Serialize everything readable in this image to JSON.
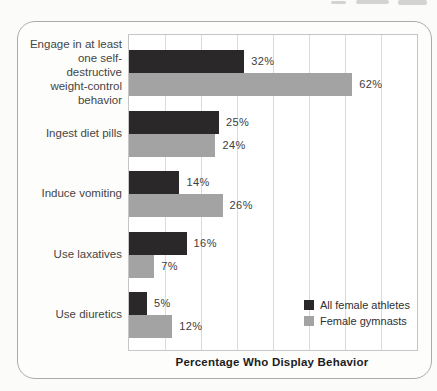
{
  "chart_data": {
    "type": "bar",
    "orientation": "horizontal",
    "title": "",
    "xlabel": "Percentage Who Display Behavior",
    "ylabel": "",
    "xlim": [
      0,
      80
    ],
    "gridline_interval": 10,
    "grid": "vertical",
    "tick_labels_shown": false,
    "legend_position": "inside-bottom-right",
    "value_suffix": "%",
    "categories": [
      "Engage in at least one self-destructive weight-control behavior",
      "Ingest diet pills",
      "Induce vomiting",
      "Use laxatives",
      "Use diuretics"
    ],
    "category_lines": [
      [
        "Engage in at least",
        "one self-destructive",
        "weight-control",
        "behavior"
      ],
      [
        "Ingest diet pills"
      ],
      [
        "Induce vomiting"
      ],
      [
        "Use laxatives"
      ],
      [
        "Use diuretics"
      ]
    ],
    "series": [
      {
        "name": "All female athletes",
        "color": "#2a2829",
        "values": [
          32,
          25,
          14,
          16,
          5
        ]
      },
      {
        "name": "Female gymnasts",
        "color": "#a3a3a3",
        "values": [
          62,
          24,
          26,
          7,
          12
        ]
      }
    ]
  },
  "colors": {
    "panel_border": "#ababab",
    "plot_border": "#c6c6c6",
    "gridline": "#dadada",
    "page_background": "#fbfbf9"
  }
}
